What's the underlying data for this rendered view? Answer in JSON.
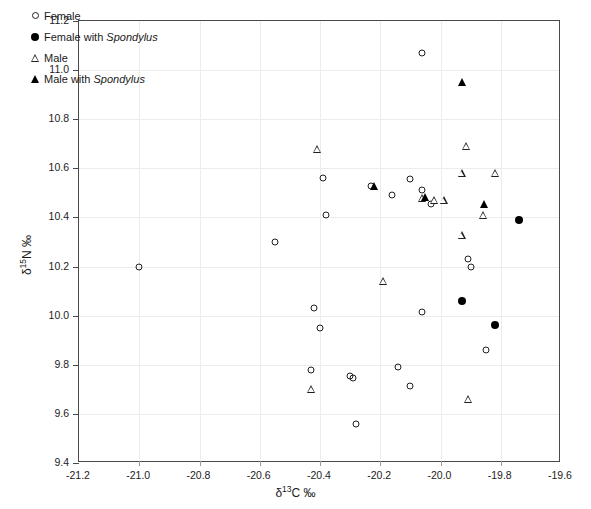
{
  "chart_data": {
    "type": "scatter",
    "title": "",
    "xlabel": "δ13C ‰",
    "ylabel": "δ15N ‰",
    "xlabel_parts": {
      "delta": "δ",
      "sup": "13",
      "element": "C ‰"
    },
    "ylabel_parts": {
      "delta": "δ",
      "sup": "15",
      "element": "N ‰"
    },
    "xlim": [
      -21.2,
      -19.6
    ],
    "ylim": [
      9.4,
      11.2
    ],
    "xticks": [
      "-21.2",
      "-21.0",
      "-20.8",
      "-20.6",
      "-20.4",
      "-20.2",
      "-20.0",
      "-19.8",
      "-19.6"
    ],
    "xtick_values": [
      -21.2,
      -21.0,
      -20.8,
      -20.6,
      -20.4,
      -20.2,
      -20.0,
      -19.8,
      -19.6
    ],
    "yticks": [
      "9.4",
      "9.6",
      "9.8",
      "10.0",
      "10.2",
      "10.4",
      "10.6",
      "10.8",
      "11.0",
      "11.2"
    ],
    "ytick_values": [
      9.4,
      9.6,
      9.8,
      10.0,
      10.2,
      10.4,
      10.6,
      10.8,
      11.0,
      11.2
    ],
    "grid": true,
    "grid_color": "#ececec",
    "legend_position": "top-left",
    "marker_color": "#000000",
    "series": [
      {
        "name": "Female",
        "marker": "open-circle",
        "points": [
          [
            -21.0,
            10.2
          ],
          [
            -20.55,
            10.3
          ],
          [
            -20.39,
            10.56
          ],
          [
            -20.38,
            10.41
          ],
          [
            -20.42,
            10.03
          ],
          [
            -20.4,
            9.95
          ],
          [
            -20.43,
            9.78
          ],
          [
            -20.3,
            9.755
          ],
          [
            -20.29,
            9.745
          ],
          [
            -20.28,
            9.56
          ],
          [
            -20.23,
            10.53
          ],
          [
            -20.16,
            10.49
          ],
          [
            -20.1,
            10.555
          ],
          [
            -20.06,
            11.07
          ],
          [
            -20.06,
            10.51
          ],
          [
            -20.03,
            10.455
          ],
          [
            -20.06,
            10.015
          ],
          [
            -20.14,
            9.79
          ],
          [
            -20.1,
            9.715
          ],
          [
            -19.91,
            10.23
          ],
          [
            -19.9,
            10.2
          ],
          [
            -19.85,
            9.86
          ]
        ]
      },
      {
        "name": "Female with Spondylus",
        "marker": "filled-circle",
        "points": [
          [
            -19.93,
            10.06
          ],
          [
            -19.82,
            9.96
          ],
          [
            -19.74,
            10.39
          ]
        ]
      },
      {
        "name": "Male",
        "marker": "open-triangle",
        "points": [
          [
            -20.41,
            10.68
          ],
          [
            -20.43,
            9.7
          ],
          [
            -20.06,
            10.48
          ],
          [
            -20.02,
            10.47
          ],
          [
            -19.915,
            10.69
          ],
          [
            -19.93,
            10.58
          ],
          [
            -19.99,
            10.47
          ],
          [
            -19.82,
            10.58
          ],
          [
            -19.86,
            10.41
          ],
          [
            -19.93,
            10.33
          ],
          [
            -19.91,
            9.66
          ],
          [
            -20.19,
            10.14
          ]
        ]
      },
      {
        "name": "Male with Spondylus",
        "marker": "filled-triangle",
        "points": [
          [
            -20.22,
            10.53
          ],
          [
            -20.05,
            10.485
          ],
          [
            -19.93,
            10.95
          ],
          [
            -19.855,
            10.455
          ]
        ]
      }
    ]
  },
  "legend": {
    "items": [
      {
        "label": "Female",
        "italic": "",
        "marker": "open-circle"
      },
      {
        "label": "Female with ",
        "italic": "Spondylus",
        "marker": "filled-circle"
      },
      {
        "label": "Male",
        "italic": "",
        "marker": "open-triangle"
      },
      {
        "label": "Male with ",
        "italic": "Spondylus",
        "marker": "filled-triangle"
      }
    ]
  }
}
